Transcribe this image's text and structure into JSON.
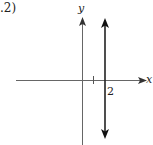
{
  "figure": {
    "corner_label": ".2)",
    "axes": {
      "x_label": "x",
      "y_label": "y"
    },
    "line": {
      "equation": "x = 2",
      "tick_label": "2"
    },
    "colors": {
      "axis": "#666666",
      "line": "#222222",
      "background": "#ffffff"
    }
  }
}
